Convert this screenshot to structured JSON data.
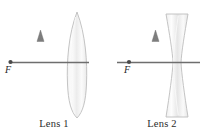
{
  "figure": {
    "background_color": "#ffffff",
    "width": 216,
    "height": 135
  },
  "style": {
    "axis_color": "#6e6e6e",
    "arrow_color": "#7a7a7a",
    "arrow_dark_color": "#5a5a5a",
    "lens_outline_color": "#b9b9b9",
    "lens_fill_light": "#ffffff",
    "lens_fill_shade": "#e3e3e3",
    "focal_dot_color": "#4a4a4a",
    "label_color": "#2b2b2b"
  },
  "panels": [
    {
      "id": "lens-1",
      "caption": "Lens 1",
      "lens_type": "biconvex",
      "lens_role": "converging",
      "focal_point_label": "F",
      "focal_point_side": "left",
      "object": {
        "shape": "arrow",
        "direction": "up",
        "position": "left-of-lens"
      },
      "optical_axis": {
        "orientation": "horizontal"
      }
    },
    {
      "id": "lens-2",
      "caption": "Lens 2",
      "lens_type": "biconcave",
      "lens_role": "diverging",
      "focal_point_label": "F",
      "focal_point_side": "left",
      "object": {
        "shape": "arrow",
        "direction": "up",
        "position": "left-of-lens"
      },
      "optical_axis": {
        "orientation": "horizontal"
      }
    }
  ]
}
